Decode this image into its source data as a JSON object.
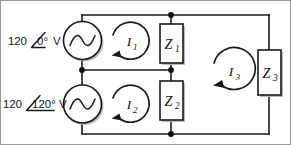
{
  "figure": {
    "background_color": "#ffffff",
    "line_color": "#1a1a1a",
    "border_color": "#9a9a9a"
  },
  "sources": [
    {
      "id": "source-1",
      "magnitude": "120",
      "angle_symbol": "∠",
      "angle": "0°",
      "unit": "V",
      "full_label": "120∠0° V",
      "symbol": "ac-source-icon"
    },
    {
      "id": "source-2",
      "magnitude": "120",
      "angle_symbol": "∠",
      "angle": "120°",
      "unit": "V",
      "full_label": "120∠120° V",
      "symbol": "ac-source-icon"
    }
  ],
  "impedances": [
    {
      "id": "z1",
      "letter": "Z",
      "subscript": "1",
      "label": "Z1"
    },
    {
      "id": "z2",
      "letter": "Z",
      "subscript": "2",
      "label": "Z2"
    },
    {
      "id": "z3",
      "letter": "Z",
      "subscript": "3",
      "label": "Z3"
    }
  ],
  "mesh_currents": [
    {
      "id": "i1",
      "letter": "I",
      "subscript": "1",
      "label": "I1",
      "direction": "clockwise"
    },
    {
      "id": "i2",
      "letter": "I",
      "subscript": "2",
      "label": "I2",
      "direction": "clockwise"
    },
    {
      "id": "i3",
      "letter": "I",
      "subscript": "3",
      "label": "I3",
      "direction": "clockwise"
    }
  ],
  "nodes": [
    {
      "id": "node-top-middle",
      "x": 170,
      "y": 14
    },
    {
      "id": "node-left-middle",
      "x": 81,
      "y": 69
    },
    {
      "id": "node-center-middle",
      "x": 170,
      "y": 69
    },
    {
      "id": "node-bottom-middle",
      "x": 170,
      "y": 133
    }
  ]
}
